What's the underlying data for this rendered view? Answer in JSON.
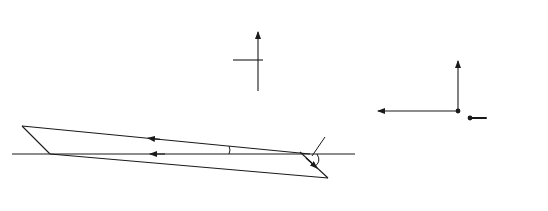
{
  "compass": {
    "north": "N",
    "south": "S",
    "east": "E",
    "west": "W"
  },
  "panel_a": {
    "label": "(a)",
    "points": {
      "B": "B",
      "P": "P",
      "O": "O",
      "A": "A"
    },
    "velocity_boat": "400",
    "velocity_current": "50",
    "angle_alpha": "α",
    "angle_current": "45°"
  },
  "panel_b": {
    "label": "(b)",
    "origin": "O",
    "components": {
      "up_num": "400 sin ",
      "up_sym": "α",
      "left_num": "400 cos ",
      "left_sym": "α",
      "right": "50 cos 45°",
      "down": "50 sin 45°"
    }
  },
  "colors": {
    "stroke": "#1a1a1a",
    "background": "#ffffff"
  }
}
